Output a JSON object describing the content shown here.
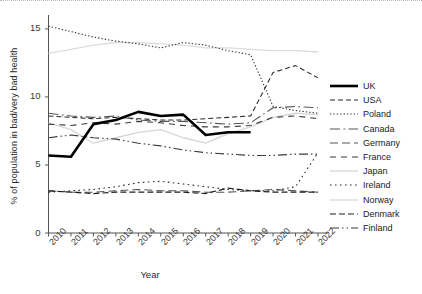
{
  "chart_data": {
    "type": "line",
    "title": "",
    "xlabel": "Year",
    "ylabel": "% of population in bad/very bad health",
    "x": [
      2010,
      2011,
      2012,
      2013,
      2014,
      2015,
      2016,
      2017,
      2018,
      2019,
      2020,
      2021,
      2022
    ],
    "xlim": [
      2010,
      2022
    ],
    "ylim": [
      0,
      15.8
    ],
    "yticks": [
      0,
      5,
      10,
      15
    ],
    "xticks": [
      "2010",
      "2011",
      "2012",
      "2013",
      "2014",
      "2015",
      "2016",
      "2017",
      "2018",
      "2019",
      "2020",
      "2021",
      "2022"
    ],
    "grid": false,
    "legend_position": "right",
    "series": [
      {
        "name": "UK",
        "style": "solid-thick",
        "color": "#000000",
        "width": 2.6,
        "values": [
          5.7,
          5.6,
          8.0,
          8.3,
          8.9,
          8.6,
          8.7,
          7.2,
          7.4,
          7.4,
          null,
          null,
          null
        ]
      },
      {
        "name": "USA",
        "style": "dashed",
        "color": "#2b2b2b",
        "width": 1.1,
        "values": [
          8.6,
          8.5,
          8.4,
          8.5,
          8.4,
          8.3,
          8.3,
          8.4,
          8.5,
          8.6,
          11.8,
          12.3,
          11.4
        ]
      },
      {
        "name": "Poland",
        "style": "dotted-fine",
        "color": "#2b2b2b",
        "width": 1.1,
        "values": [
          15.2,
          14.8,
          14.4,
          14.1,
          13.9,
          13.6,
          14.0,
          13.8,
          13.4,
          13.1,
          9.3,
          9.0,
          8.8
        ]
      },
      {
        "name": "Canada",
        "style": "dashdot-long",
        "color": "#555555",
        "width": 1.1,
        "values": [
          8.8,
          8.6,
          8.5,
          8.6,
          8.3,
          8.2,
          8.2,
          8.1,
          8.0,
          8.1,
          9.2,
          9.3,
          9.2
        ]
      },
      {
        "name": "Germany",
        "style": "dashed-long",
        "color": "#555555",
        "width": 1.1,
        "values": [
          3.1,
          3.0,
          3.0,
          3.1,
          3.2,
          3.1,
          3.1,
          3.0,
          3.0,
          3.1,
          3.2,
          3.1,
          3.0
        ]
      },
      {
        "name": "France",
        "style": "dashed-wide",
        "color": "#3a3a3a",
        "width": 1.1,
        "values": [
          8.0,
          7.9,
          8.1,
          8.0,
          8.2,
          8.1,
          7.9,
          7.8,
          7.8,
          7.9,
          8.5,
          8.6,
          8.4
        ]
      },
      {
        "name": "Japan",
        "style": "solid-light",
        "color": "#d6d6d6",
        "width": 1.3,
        "values": [
          8.1,
          7.6,
          6.6,
          7.0,
          7.4,
          7.6,
          7.0,
          6.6,
          7.3,
          7.8,
          8.5,
          8.8,
          8.7
        ]
      },
      {
        "name": "Ireland",
        "style": "dotted-sparse",
        "color": "#2b2b2b",
        "width": 1.1,
        "values": [
          3.0,
          3.1,
          3.2,
          3.4,
          3.7,
          3.8,
          3.6,
          3.4,
          3.2,
          3.1,
          3.1,
          3.4,
          5.9
        ]
      },
      {
        "name": "Norway",
        "style": "solid-light2",
        "color": "#dcdcdc",
        "width": 1.3,
        "values": [
          13.2,
          13.5,
          13.8,
          14.0,
          14.0,
          13.9,
          13.8,
          13.6,
          13.6,
          13.5,
          13.4,
          13.4,
          13.3
        ]
      },
      {
        "name": "Denmark",
        "style": "dashed-med",
        "color": "#1f1f1f",
        "width": 1.2,
        "values": [
          3.1,
          3.0,
          2.9,
          3.0,
          3.0,
          3.0,
          3.0,
          2.9,
          3.3,
          3.1,
          3.0,
          3.0,
          3.0
        ]
      },
      {
        "name": "Finland",
        "style": "dashdotdot",
        "color": "#3a3a3a",
        "width": 1.1,
        "values": [
          7.0,
          7.2,
          7.0,
          6.9,
          6.6,
          6.4,
          6.1,
          5.9,
          5.8,
          5.7,
          5.7,
          5.8,
          5.8
        ]
      }
    ]
  },
  "axes": {
    "ylabel": "% of population in bad/very bad health",
    "xlabel": "Year"
  }
}
